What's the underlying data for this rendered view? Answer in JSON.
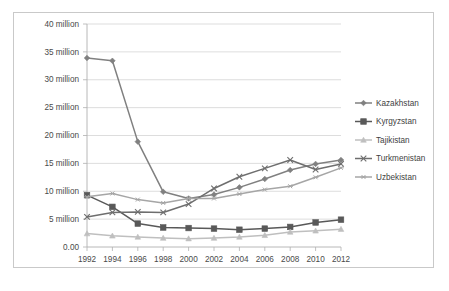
{
  "chart_data": {
    "type": "line",
    "title": "",
    "subtitle": "",
    "xlabel": "",
    "ylabel": "",
    "x": [
      1992,
      1994,
      1996,
      1998,
      2000,
      2002,
      2004,
      2006,
      2008,
      2010,
      2012
    ],
    "categories": [
      "1992",
      "1994",
      "1996",
      "1998",
      "2000",
      "2002",
      "2004",
      "2006",
      "2008",
      "2010",
      "2012"
    ],
    "xtick_labels": [
      "1992",
      "1994",
      "1996",
      "1998",
      "2000",
      "2002",
      "2004",
      "2006",
      "2008",
      "2010",
      "2012"
    ],
    "ytick_labels": [
      "0.00",
      "5 million",
      "10 million",
      "15 million",
      "20 million",
      "25 million",
      "30 million",
      "35 million",
      "40 million"
    ],
    "ytick_values": [
      0,
      5,
      10,
      15,
      20,
      25,
      30,
      35,
      40
    ],
    "ylim": [
      0,
      40
    ],
    "xlim": [
      1992,
      2012
    ],
    "units": "million",
    "grid": true,
    "legend_position": "right",
    "series": [
      {
        "name": "Kazakhstan",
        "marker": "diamond",
        "color": "#808080",
        "values": [
          33.9,
          33.4,
          18.9,
          9.9,
          8.7,
          9.4,
          10.7,
          12.2,
          13.8,
          14.9,
          15.6
        ]
      },
      {
        "name": "Kyrgyzstan",
        "marker": "square",
        "color": "#595959",
        "values": [
          9.3,
          7.2,
          4.2,
          3.5,
          3.4,
          3.3,
          3.1,
          3.3,
          3.6,
          4.4,
          4.9
        ]
      },
      {
        "name": "Tajikistan",
        "marker": "triangle",
        "color": "#bfbfbf",
        "values": [
          2.4,
          2.0,
          1.8,
          1.6,
          1.5,
          1.6,
          1.8,
          2.1,
          2.7,
          2.9,
          3.2
        ]
      },
      {
        "name": "Turkmenistan",
        "marker": "cross",
        "color": "#6e6e6e",
        "values": [
          5.4,
          6.2,
          6.3,
          6.2,
          7.7,
          10.5,
          12.6,
          14.1,
          15.6,
          13.9,
          14.9
        ]
      },
      {
        "name": "Uzbekistan",
        "marker": "star",
        "color": "#a6a6a6",
        "values": [
          9.0,
          9.6,
          8.5,
          7.9,
          8.7,
          8.7,
          9.5,
          10.3,
          10.9,
          12.5,
          14.2
        ]
      }
    ]
  },
  "legend": {
    "entries": [
      {
        "label": "Kazakhstan"
      },
      {
        "label": "Kyrgyzstan"
      },
      {
        "label": "Tajikistan"
      },
      {
        "label": "Turkmenistan"
      },
      {
        "label": "Uzbekistan"
      }
    ]
  }
}
